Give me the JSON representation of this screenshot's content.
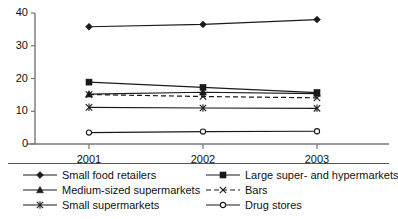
{
  "chart_data": {
    "type": "line",
    "title": "",
    "xlabel": "",
    "ylabel": "",
    "categories": [
      "2001",
      "2002",
      "2003"
    ],
    "x_tick_labels": [
      "2001",
      "2002",
      "2003"
    ],
    "y_tick_labels": [
      "0",
      "10",
      "20",
      "30",
      "40"
    ],
    "y_ticks": [
      0,
      10,
      20,
      30,
      40
    ],
    "ylim": [
      0,
      40
    ],
    "grid": false,
    "legend_position": "bottom",
    "legend_columns": 2,
    "series": [
      {
        "name": "Small food retailers",
        "marker": "diamond",
        "line_style": "solid",
        "color": "#1a1a1a",
        "values": [
          35.8,
          36.5,
          38.0
        ]
      },
      {
        "name": "Large super- and hypermarkets",
        "marker": "square",
        "line_style": "solid",
        "color": "#1a1a1a",
        "values": [
          18.9,
          17.3,
          15.7
        ]
      },
      {
        "name": "Medium-sized supermarkets",
        "marker": "triangle",
        "line_style": "solid",
        "color": "#1a1a1a",
        "values": [
          15.2,
          15.8,
          15.4
        ]
      },
      {
        "name": "Bars",
        "marker": "cross",
        "line_style": "dashed",
        "color": "#1a1a1a",
        "values": [
          15.1,
          14.5,
          14.1
        ]
      },
      {
        "name": "Small supermarkets",
        "marker": "asterisk",
        "line_style": "solid",
        "color": "#1a1a1a",
        "values": [
          11.2,
          11.0,
          10.9
        ]
      },
      {
        "name": "Drug stores",
        "marker": "circle-open",
        "line_style": "solid",
        "color": "#1a1a1a",
        "values": [
          3.5,
          3.8,
          3.9
        ]
      }
    ]
  },
  "legend": {
    "columns": [
      {
        "entries": [
          {
            "label": "Small food retailers",
            "marker": "diamond",
            "line_style": "solid"
          },
          {
            "label": "Medium-sized supermarkets",
            "marker": "triangle",
            "line_style": "solid"
          },
          {
            "label": "Small supermarkets",
            "marker": "asterisk",
            "line_style": "solid"
          }
        ]
      },
      {
        "entries": [
          {
            "label": "Large super- and hypermarkets",
            "marker": "square",
            "line_style": "solid"
          },
          {
            "label": "Bars",
            "marker": "cross",
            "line_style": "dashed"
          },
          {
            "label": "Drug stores",
            "marker": "circle-open",
            "line_style": "solid"
          }
        ]
      }
    ]
  },
  "axis": {
    "line_color": "#777777"
  }
}
